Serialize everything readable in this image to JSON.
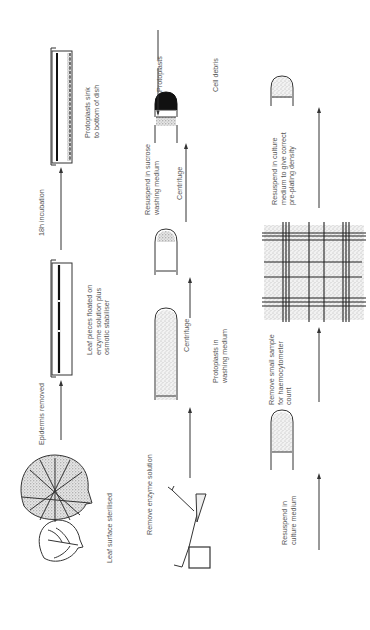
{
  "diagram": {
    "orientation": "rotated-90-ccw",
    "reading_order": "bottom-to-top, rows left-to-right",
    "row1": {
      "steps": [
        {
          "id": "leaf",
          "label": "Leaf surface sterilised"
        },
        {
          "id": "arrow1",
          "label": "Epidermis removed"
        },
        {
          "id": "dish1",
          "label_lines": [
            "Leaf pieces floated on",
            "enzyme solution plus",
            "osmotic stabiliser"
          ]
        },
        {
          "id": "arrow2",
          "label": "18h incubation"
        },
        {
          "id": "dish2",
          "label_lines": [
            "Protoplasts sink",
            "to bottom of dish"
          ]
        }
      ]
    },
    "row2": {
      "steps": [
        {
          "id": "filter",
          "label": "Remove enzyme solution"
        },
        {
          "id": "tube1",
          "label_lines": [
            "Protoplasts in",
            "washing medium"
          ]
        },
        {
          "id": "arrow3",
          "label": "Centrifuge"
        },
        {
          "id": "tube2",
          "label_lines": [
            "Resuspend in sucrose",
            "washing medium"
          ]
        },
        {
          "id": "arrow4",
          "label": "Centrifuge"
        },
        {
          "id": "tube3",
          "callouts": [
            "Protoplasts",
            "Cell debris"
          ]
        }
      ]
    },
    "row3": {
      "steps": [
        {
          "id": "arrow5",
          "label_lines": [
            "Resuspend in",
            "culture medium"
          ]
        },
        {
          "id": "tube4"
        },
        {
          "id": "arrow6",
          "label_lines": [
            "Remove small sample",
            "for haemocytometer",
            "count"
          ]
        },
        {
          "id": "grid"
        },
        {
          "id": "arrow7",
          "label_lines": [
            "Resuspend in culture",
            "medium to give correct",
            "pre-plating density"
          ]
        },
        {
          "id": "tube5"
        }
      ]
    }
  }
}
